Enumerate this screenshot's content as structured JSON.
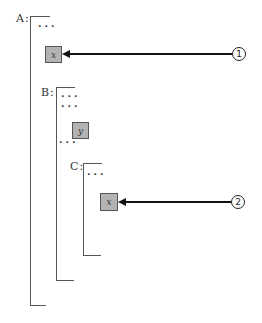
{
  "diagram": {
    "frames": [
      {
        "id": "A",
        "label": "A:",
        "ellipsis_top": "...",
        "content": "x",
        "callout": "1"
      },
      {
        "id": "B",
        "label": "B:",
        "ellipsis_1": "...",
        "ellipsis_2": "...",
        "content": "y",
        "ellipsis_after": "..."
      },
      {
        "id": "C",
        "label": "C:",
        "ellipsis_top": "...",
        "content": "x",
        "callout": "2"
      }
    ],
    "colors": {
      "box_fill": "#b3b3b3",
      "bracket": "#555555",
      "arrow": "#111111"
    }
  }
}
